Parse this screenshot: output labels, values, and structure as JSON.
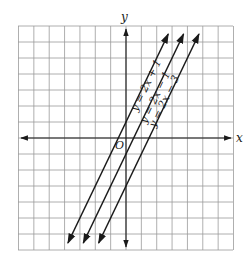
{
  "chart_data": {
    "type": "line",
    "title": "",
    "xlabel": "x",
    "ylabel": "y",
    "origin_label": "O",
    "grid": true,
    "xlim": [
      -7,
      7
    ],
    "ylim": [
      -7,
      7
    ],
    "series": [
      {
        "name": "y = 2x + 1",
        "slope": 2,
        "intercept": 1
      },
      {
        "name": "y = 2x − 1",
        "slope": 2,
        "intercept": -1
      },
      {
        "name": "y = 2x − 3",
        "slope": 2,
        "intercept": -3
      }
    ]
  },
  "diagram": {
    "axis_x_label": "x",
    "axis_y_label": "y",
    "origin_label": "O",
    "line_labels": [
      "y = 2x + 1",
      "y = 2x − 1",
      "y = 2x − 3"
    ],
    "colors": {
      "grid": "#9a9a9a",
      "ink": "#1a1a1a",
      "background": "#ffffff"
    }
  }
}
